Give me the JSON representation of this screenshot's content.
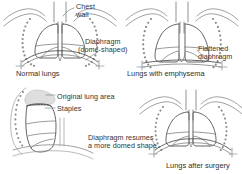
{
  "diagram": {
    "colors": {
      "outline": "#4a4a4a",
      "rib_dots": "#8a8a8a",
      "shading": "#dcdcdc",
      "text": "#333333",
      "background": "#ffffff"
    },
    "panels": [
      {
        "id": "normal-lungs",
        "caption": "Normal lungs",
        "labels": [
          {
            "id": "chest-wall",
            "line1": "Chest",
            "line2": "wall"
          },
          {
            "id": "diaphragm-dome",
            "line1": "Diaphragm",
            "line2": "(dome-shaped)"
          }
        ]
      },
      {
        "id": "emphysema-lungs",
        "caption": "Lungs with emphysema",
        "labels": [
          {
            "id": "flattened-diaphragm",
            "line1": "Flattened",
            "line2": "diaphragm"
          }
        ]
      },
      {
        "id": "surgery-detail",
        "caption": "",
        "labels": [
          {
            "id": "original-lung-area",
            "line1": "Original lung area",
            "line2": ""
          },
          {
            "id": "staples",
            "line1": "Staples",
            "line2": ""
          }
        ]
      },
      {
        "id": "after-surgery-lungs",
        "caption": "Lungs after surgery",
        "labels": [
          {
            "id": "diaphragm-resumes",
            "line1": "Diaphragm resumes",
            "line2": "a more domed shape"
          }
        ]
      }
    ]
  }
}
